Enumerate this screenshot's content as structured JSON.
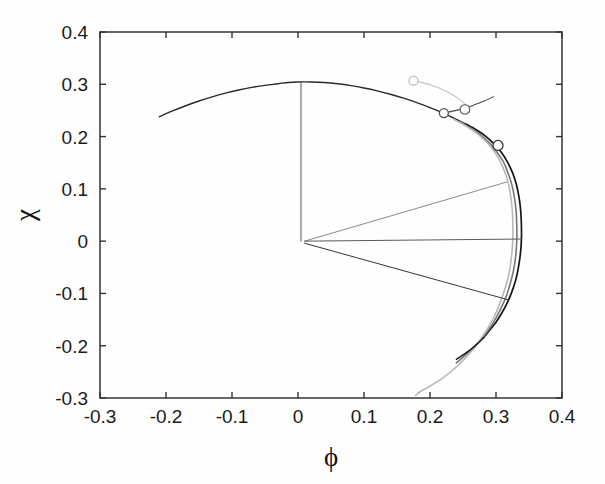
{
  "figure": {
    "name": "phase-portrait-plot",
    "background": "#fefefe"
  },
  "chart_data": {
    "type": "line",
    "title": "",
    "xlabel": "ϕ",
    "ylabel": "χ",
    "xlim": [
      -0.3,
      0.4
    ],
    "ylim": [
      -0.3,
      0.4
    ],
    "grid": false,
    "legend": null,
    "xticks": [
      -0.3,
      -0.2,
      -0.1,
      0,
      0.1,
      0.2,
      0.3,
      0.4
    ],
    "xticklabels": [
      "-0.3",
      "-0.2",
      "-0.1",
      "0",
      "0.1",
      "0.2",
      "0.3",
      "0.4"
    ],
    "yticks": [
      -0.3,
      -0.2,
      -0.1,
      0,
      0.1,
      0.2,
      0.3,
      0.4
    ],
    "yticklabels": [
      "-0.3",
      "-0.2",
      "-0.1",
      "0",
      "0.1",
      "0.2",
      "0.3",
      "0.4"
    ],
    "colors": {
      "axis": "#333333",
      "dark_curve": "#111111",
      "mid_curve": "#6e6e6e",
      "light_curve": "#b3b3b3",
      "thin_line": "#555555"
    },
    "series": [
      {
        "name": "upper-branch-dark",
        "color": "#2a2a2a",
        "width": 1.4,
        "points": [
          [
            -0.21,
            0.238
          ],
          [
            -0.19,
            0.249
          ],
          [
            -0.17,
            0.259
          ],
          [
            -0.15,
            0.268
          ],
          [
            -0.13,
            0.276
          ],
          [
            -0.11,
            0.283
          ],
          [
            -0.09,
            0.289
          ],
          [
            -0.07,
            0.294
          ],
          [
            -0.05,
            0.298
          ],
          [
            -0.03,
            0.301
          ],
          [
            -0.015,
            0.3035
          ],
          [
            0.0,
            0.3045
          ],
          [
            0.02,
            0.3045
          ],
          [
            0.04,
            0.3035
          ],
          [
            0.06,
            0.301
          ],
          [
            0.08,
            0.2975
          ],
          [
            0.1,
            0.293
          ],
          [
            0.12,
            0.2875
          ],
          [
            0.14,
            0.281
          ],
          [
            0.16,
            0.2735
          ],
          [
            0.18,
            0.265
          ],
          [
            0.2,
            0.2555
          ],
          [
            0.22,
            0.245
          ],
          [
            0.24,
            0.233
          ],
          [
            0.255,
            0.2235
          ]
        ]
      },
      {
        "name": "outer-dark-arc",
        "color": "#141414",
        "width": 1.7,
        "points": [
          [
            0.255,
            0.2235
          ],
          [
            0.27,
            0.213
          ],
          [
            0.285,
            0.2
          ],
          [
            0.297,
            0.186
          ],
          [
            0.308,
            0.17
          ],
          [
            0.317,
            0.152
          ],
          [
            0.325,
            0.131
          ],
          [
            0.331,
            0.108
          ],
          [
            0.335,
            0.083
          ],
          [
            0.3375,
            0.057
          ],
          [
            0.3385,
            0.03
          ],
          [
            0.3385,
            0.003
          ],
          [
            0.337,
            -0.024
          ],
          [
            0.334,
            -0.05
          ],
          [
            0.33,
            -0.074
          ],
          [
            0.324,
            -0.097
          ],
          [
            0.317,
            -0.118
          ],
          [
            0.309,
            -0.137
          ],
          [
            0.3,
            -0.155
          ],
          [
            0.29,
            -0.171
          ],
          [
            0.281,
            -0.185
          ]
        ]
      },
      {
        "name": "middle-gray-arc",
        "color": "#777777",
        "width": 1.6,
        "points": [
          [
            0.246,
            0.228
          ],
          [
            0.262,
            0.216
          ],
          [
            0.277,
            0.203
          ],
          [
            0.29,
            0.188
          ],
          [
            0.301,
            0.171
          ],
          [
            0.311,
            0.152
          ],
          [
            0.318,
            0.131
          ],
          [
            0.324,
            0.108
          ],
          [
            0.328,
            0.083
          ],
          [
            0.3305,
            0.057
          ],
          [
            0.3315,
            0.03
          ],
          [
            0.3315,
            0.002
          ],
          [
            0.33,
            -0.026
          ],
          [
            0.327,
            -0.053
          ],
          [
            0.322,
            -0.079
          ],
          [
            0.316,
            -0.104
          ],
          [
            0.308,
            -0.127
          ],
          [
            0.299,
            -0.149
          ],
          [
            0.289,
            -0.169
          ],
          [
            0.277,
            -0.188
          ],
          [
            0.265,
            -0.205
          ],
          [
            0.252,
            -0.22
          ],
          [
            0.24,
            -0.233
          ]
        ]
      },
      {
        "name": "inner-light-arc",
        "color": "#b8b8b8",
        "width": 1.6,
        "points": [
          [
            0.236,
            0.233
          ],
          [
            0.252,
            0.222
          ],
          [
            0.268,
            0.209
          ],
          [
            0.282,
            0.194
          ],
          [
            0.294,
            0.177
          ],
          [
            0.304,
            0.158
          ],
          [
            0.312,
            0.137
          ],
          [
            0.318,
            0.114
          ],
          [
            0.322,
            0.089
          ],
          [
            0.3245,
            0.062
          ],
          [
            0.3255,
            0.034
          ],
          [
            0.3255,
            0.005
          ],
          [
            0.324,
            -0.024
          ],
          [
            0.321,
            -0.053
          ],
          [
            0.316,
            -0.081
          ],
          [
            0.309,
            -0.108
          ],
          [
            0.301,
            -0.134
          ],
          [
            0.291,
            -0.159
          ],
          [
            0.279,
            -0.183
          ],
          [
            0.266,
            -0.206
          ],
          [
            0.251,
            -0.227
          ],
          [
            0.235,
            -0.246
          ],
          [
            0.218,
            -0.263
          ],
          [
            0.2,
            -0.277
          ],
          [
            0.185,
            -0.288
          ],
          [
            0.178,
            -0.295
          ]
        ]
      },
      {
        "name": "dark-tail-lower",
        "color": "#1c1c1c",
        "width": 1.5,
        "points": [
          [
            0.281,
            -0.185
          ],
          [
            0.272,
            -0.196
          ],
          [
            0.263,
            -0.206
          ],
          [
            0.254,
            -0.214
          ],
          [
            0.246,
            -0.221
          ],
          [
            0.24,
            -0.226
          ]
        ]
      },
      {
        "name": "vertical-stem",
        "color": "#555555",
        "width": 1.0,
        "points": [
          [
            0.0045,
            0.3045
          ],
          [
            0.0045,
            0.0
          ]
        ]
      },
      {
        "name": "radial-line-upper",
        "color": "#8a8a8a",
        "width": 1.0,
        "points": [
          [
            0.01,
            0.0
          ],
          [
            0.316,
            0.113
          ]
        ]
      },
      {
        "name": "radial-line-middle",
        "color": "#5a5a5a",
        "width": 1.0,
        "points": [
          [
            0.01,
            0.0
          ],
          [
            0.3385,
            0.004
          ]
        ]
      },
      {
        "name": "radial-line-lower",
        "color": "#333333",
        "width": 1.0,
        "points": [
          [
            0.01,
            -0.004
          ],
          [
            0.318,
            -0.112
          ]
        ]
      },
      {
        "name": "leader-light-marker",
        "color": "#c2c2c2",
        "width": 1.1,
        "points": [
          [
            0.175,
            0.307
          ],
          [
            0.2,
            0.299
          ],
          [
            0.224,
            0.287
          ],
          [
            0.244,
            0.272
          ],
          [
            0.256,
            0.258
          ]
        ]
      },
      {
        "name": "leader-dark-marker",
        "color": "#4a4a4a",
        "width": 1.1,
        "points": [
          [
            0.221,
            0.245
          ],
          [
            0.243,
            0.251
          ],
          [
            0.264,
            0.259
          ],
          [
            0.282,
            0.268
          ],
          [
            0.296,
            0.276
          ]
        ]
      }
    ],
    "markers": [
      {
        "name": "marker-light-outer",
        "x": 0.175,
        "y": 0.307,
        "r": 4.5,
        "color": "#bdbdbd",
        "fill": "#ffffff"
      },
      {
        "name": "marker-dark-inner",
        "x": 0.221,
        "y": 0.245,
        "r": 4.5,
        "color": "#4f4f4f",
        "fill": "#ffffff"
      },
      {
        "name": "marker-arc-upper",
        "x": 0.253,
        "y": 0.252,
        "r": 4.8,
        "color": "#6b6b6b",
        "fill": "#ffffff"
      },
      {
        "name": "marker-arc-lower",
        "x": 0.303,
        "y": 0.183,
        "r": 5.0,
        "color": "#3a3a3a",
        "fill": "#ffffff"
      }
    ]
  }
}
